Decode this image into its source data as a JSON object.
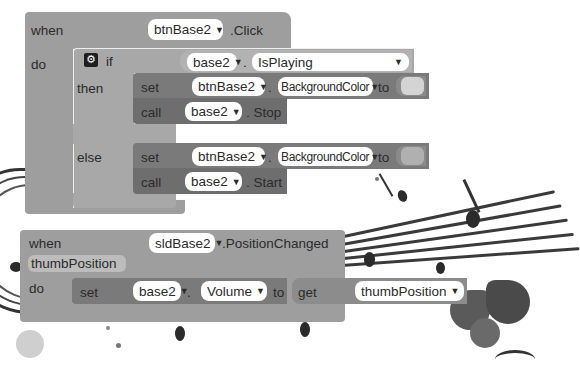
{
  "event_click": {
    "when_label": "when",
    "component": "btnBase2",
    "event": ".Click",
    "do_label": "do",
    "if_block": {
      "if_label": "if",
      "condition": {
        "component": "base2",
        "dot": ".",
        "property": "IsPlaying"
      },
      "then_label": "then",
      "then_set": {
        "set_label": "set",
        "component": "btnBase2",
        "dot": ".",
        "property": "BackgroundColor",
        "to_label": "to",
        "color_value": "#d4d4d4"
      },
      "then_call": {
        "call_label": "call",
        "component": "base2",
        "method": ". Stop"
      },
      "else_label": "else",
      "else_set": {
        "set_label": "set",
        "component": "btnBase2",
        "dot": ".",
        "property": "BackgroundColor",
        "to_label": "to",
        "color_value": "#b0b0b0"
      },
      "else_call": {
        "call_label": "call",
        "component": "base2",
        "method": ". Start"
      }
    }
  },
  "event_position": {
    "when_label": "when",
    "component": "sldBase2",
    "event": ".PositionChanged",
    "param": "thumbPosition",
    "do_label": "do",
    "set": {
      "set_label": "set",
      "component": "base2",
      "dot": ".",
      "property": "Volume",
      "to_label": "to",
      "get_label": "get",
      "get_value": "thumbPosition"
    }
  },
  "icons": {
    "caret": "▼",
    "gear": "⚙"
  },
  "colors": {
    "event_block": "#9e9e9e",
    "if_block": "#a8a8a8",
    "set_block": "#7a7a7a",
    "call_block": "#6e6e6e",
    "field": "#ffffff"
  }
}
